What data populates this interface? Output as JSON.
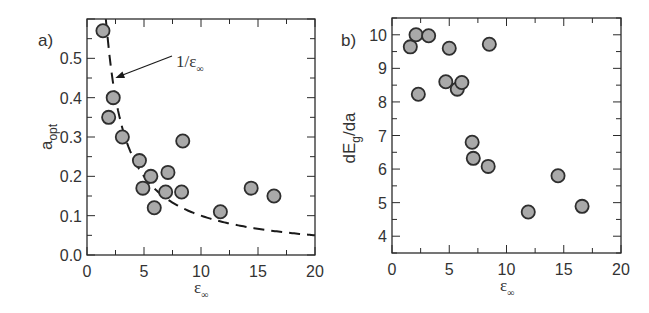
{
  "chart_data": [
    {
      "panel": "a)",
      "type": "scatter",
      "title": "",
      "xlabel": "ε∞",
      "ylabel": "a_opt",
      "xlim": [
        0,
        20
      ],
      "ylim": [
        0,
        0.6
      ],
      "xticks": [
        0,
        5,
        10,
        15,
        20
      ],
      "xtick_labels": [
        "0",
        "5",
        "10",
        "15",
        "20"
      ],
      "yticks": [
        0.0,
        0.1,
        0.2,
        0.3,
        0.4,
        0.5
      ],
      "ytick_labels": [
        "0.0",
        "0.1",
        "0.2",
        "0.3",
        "0.4",
        "0.5"
      ],
      "grid": false,
      "legend": null,
      "series": [
        {
          "name": "data",
          "marker": "circle",
          "points": [
            [
              1.4,
              0.57
            ],
            [
              2.3,
              0.4
            ],
            [
              1.9,
              0.35
            ],
            [
              3.1,
              0.3
            ],
            [
              8.4,
              0.29
            ],
            [
              4.6,
              0.24
            ],
            [
              5.6,
              0.2
            ],
            [
              7.1,
              0.21
            ],
            [
              4.9,
              0.17
            ],
            [
              6.9,
              0.16
            ],
            [
              8.3,
              0.16
            ],
            [
              5.9,
              0.12
            ],
            [
              11.7,
              0.11
            ],
            [
              14.4,
              0.17
            ],
            [
              16.4,
              0.15
            ]
          ]
        },
        {
          "name": "1/ε∞",
          "type": "line",
          "style": "dashed",
          "function": "1/x",
          "x_range": [
            1.65,
            20
          ]
        }
      ],
      "annotations": [
        {
          "text": "1/ε∞",
          "text_main": "1/ε",
          "text_sub": "∞",
          "arrow_to": [
            2.4,
            0.45
          ]
        }
      ]
    },
    {
      "panel": "b)",
      "type": "scatter",
      "title": "",
      "xlabel": "ε∞",
      "ylabel": "dE_g/da",
      "xlim": [
        0,
        20
      ],
      "ylim": [
        3.5,
        10.5
      ],
      "xticks": [
        0,
        5,
        10,
        15,
        20
      ],
      "xtick_labels": [
        "0",
        "5",
        "10",
        "15",
        "20"
      ],
      "yticks": [
        4,
        5,
        6,
        7,
        8,
        9,
        10
      ],
      "ytick_labels": [
        "4",
        "5",
        "6",
        "7",
        "8",
        "9",
        "10"
      ],
      "grid": false,
      "legend": null,
      "series": [
        {
          "name": "data",
          "marker": "circle",
          "points": [
            [
              1.6,
              9.64
            ],
            [
              2.1,
              10.0
            ],
            [
              3.2,
              9.97
            ],
            [
              2.3,
              8.23
            ],
            [
              5.0,
              9.6
            ],
            [
              8.5,
              9.72
            ],
            [
              4.7,
              8.6
            ],
            [
              5.7,
              8.38
            ],
            [
              6.1,
              8.58
            ],
            [
              7.0,
              6.8
            ],
            [
              7.1,
              6.32
            ],
            [
              8.4,
              6.08
            ],
            [
              11.9,
              4.72
            ],
            [
              14.5,
              5.8
            ],
            [
              16.6,
              4.89
            ]
          ]
        }
      ],
      "annotations": []
    }
  ],
  "panels": {
    "a": {
      "label": "a)",
      "ylabel_main": "a",
      "ylabel_sub": "opt",
      "xlabel_main": "ε",
      "xlabel_sub": "∞",
      "annotation_main": "1/ε",
      "annotation_sub": "∞"
    },
    "b": {
      "label": "b)",
      "ylabel_main": "dE",
      "ylabel_sub": "g",
      "ylabel_tail": "/da",
      "xlabel_main": "ε",
      "xlabel_sub": "∞"
    }
  },
  "style": {
    "marker_fill": "#a9a9a9",
    "marker_stroke": "#2e2e2e",
    "axis_color": "#2b2b2b",
    "curve_color": "#1a1a1a"
  }
}
